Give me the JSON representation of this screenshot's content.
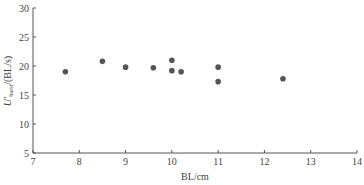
{
  "chart_data": {
    "type": "scatter",
    "title": "",
    "xlabel": "BL/cm",
    "ylabel": "U'burst/(BL/s)",
    "ylabel_parts": {
      "main": "U'",
      "sub": "burst",
      "unit": "/(BL/s)"
    },
    "xlim": [
      7,
      14
    ],
    "ylim": [
      5,
      30
    ],
    "x_ticks": [
      7,
      8,
      9,
      10,
      11,
      12,
      13,
      14
    ],
    "y_ticks": [
      5,
      10,
      15,
      20,
      25,
      30
    ],
    "grid": false,
    "legend": null,
    "marker_color": "#555555",
    "points": [
      {
        "x": 7.7,
        "y": 19.0
      },
      {
        "x": 8.5,
        "y": 20.8
      },
      {
        "x": 9.0,
        "y": 19.8
      },
      {
        "x": 9.6,
        "y": 19.7
      },
      {
        "x": 10.0,
        "y": 21.0
      },
      {
        "x": 10.0,
        "y": 19.2
      },
      {
        "x": 10.2,
        "y": 19.0
      },
      {
        "x": 11.0,
        "y": 19.8
      },
      {
        "x": 11.0,
        "y": 17.3
      },
      {
        "x": 12.4,
        "y": 17.8
      }
    ]
  }
}
